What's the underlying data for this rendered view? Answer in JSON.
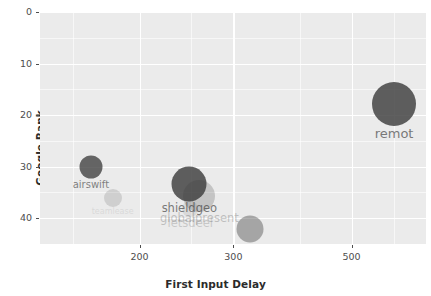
{
  "chart_data": {
    "type": "scatter",
    "title": "",
    "subtitle": "",
    "xlabel": "First Input Delay",
    "ylabel": "Google Rank",
    "xscale": "log",
    "yscale": "linear",
    "xlim": [
      130,
      690
    ],
    "ylim": [
      0,
      45
    ],
    "y_inverted": true,
    "grid": true,
    "legend": "none",
    "xticks": [
      200,
      300,
      500
    ],
    "xtick_labels": [
      "200",
      "300",
      "500"
    ],
    "yticks": [
      0,
      10,
      20,
      30,
      40
    ],
    "ytick_labels": [
      "0",
      "10",
      "20",
      "30",
      "40"
    ],
    "point_color": "#3d3d3d",
    "panel_color": "#ebebeb",
    "grid_color": "#ffffff",
    "points": [
      {
        "label": "airswift",
        "x": 162,
        "y": 30.0,
        "size": 11.5,
        "opacity": 0.78,
        "label_opacity": 0.62,
        "label_size": 10
      },
      {
        "label": "teamlease",
        "x": 178,
        "y": 36.0,
        "size": 9.0,
        "opacity": 0.16,
        "label_opacity": 0.1,
        "label_size": 8
      },
      {
        "label": "shieldgeo",
        "x": 248,
        "y": 33.4,
        "size": 17.5,
        "opacity": 0.82,
        "label_opacity": 0.66,
        "label_size": 11.5
      },
      {
        "label": "globalpresent",
        "x": 259,
        "y": 35.6,
        "size": 16.0,
        "opacity": 0.22,
        "label_opacity": 0.26,
        "label_size": 11.5
      },
      {
        "label": "letsdeel",
        "x": 249,
        "y": 38.2,
        "size": 8.0,
        "opacity": 0.1,
        "label_opacity": 0.2,
        "label_size": 11.5
      },
      {
        "label": "papaya",
        "x": 322,
        "y": 42.0,
        "size": 13.5,
        "opacity": 0.4,
        "label_opacity": 0.46,
        "label_size": 11
      },
      {
        "label": "remot",
        "x": 601,
        "y": 17.8,
        "size": 22.0,
        "opacity": 0.82,
        "label_opacity": 0.66,
        "label_size": 13
      }
    ]
  }
}
